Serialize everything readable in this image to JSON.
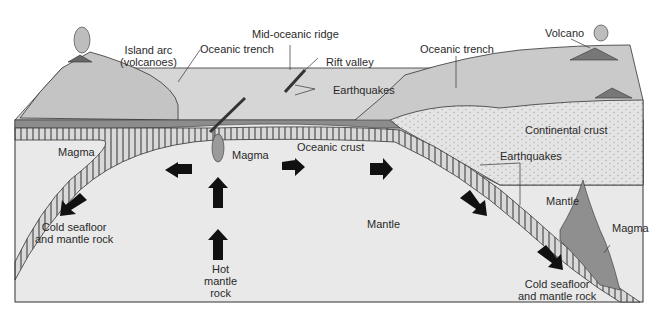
{
  "diagram": {
    "type": "plate-tectonics-cross-section",
    "colors": {
      "mantle": "#e9e9e9",
      "surface": "#cfcfcf",
      "ocean_layer": "#8c8c8c",
      "continental_crust": "#e3e3e3",
      "magma": "#8f8f8f",
      "arrow": "#111111",
      "outline": "#333333"
    },
    "labels": {
      "island_arc_1": "Island arc",
      "island_arc_2": "(volcanoes)",
      "oceanic_trench_left": "Oceanic trench",
      "mid_oceanic_ridge": "Mid-oceanic ridge",
      "rift_valley": "Rift valley",
      "earthquakes_ridge": "Earthquakes",
      "oceanic_trench_right": "Oceanic trench",
      "volcano": "Volcano",
      "continental_crust": "Continental crust",
      "earthquakes_right": "Earthquakes",
      "magma_left": "Magma",
      "magma_center": "Magma",
      "oceanic_crust": "Oceanic crust",
      "mantle_center": "Mantle",
      "mantle_right": "Mantle",
      "magma_right": "Magma",
      "cold_left_1": "Cold seafloor",
      "cold_left_2": "and mantle rock",
      "hot_1": "Hot",
      "hot_2": "mantle",
      "hot_3": "rock",
      "cold_right_1": "Cold seafloor",
      "cold_right_2": "and mantle rock"
    }
  }
}
